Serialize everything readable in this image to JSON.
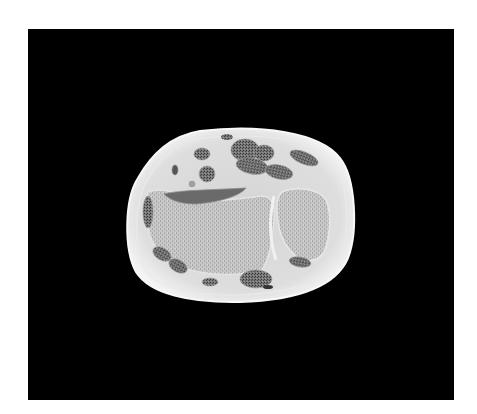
{
  "image": {
    "subject": "anatomical cross-section specimen",
    "description": "Grayscale transverse slice of a wrist/forearm on a black background",
    "colors": {
      "page_background": "#ffffff",
      "photo_background": "#000000",
      "skin_rim": "#f2f2f2",
      "soft_tissue": "#d9d9d9",
      "bone": "#c4c4c4",
      "bone_texture": "#a8a8a8",
      "muscle_tendon": "#6e6e6e",
      "muscle_texture": "#3a3a3a",
      "dark_cleft": "#555555"
    }
  }
}
